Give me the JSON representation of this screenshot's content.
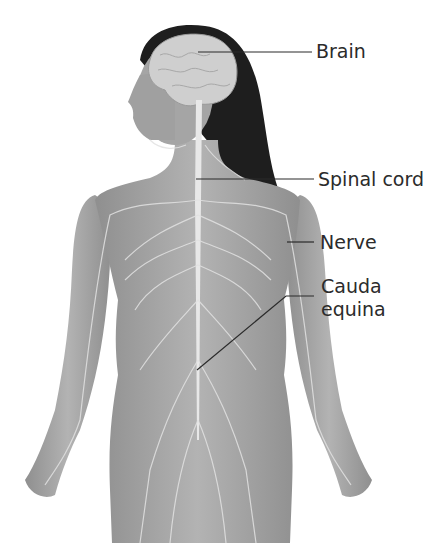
{
  "diagram": {
    "labels": [
      {
        "id": "brain",
        "text": "Brain",
        "x": 316,
        "y": 39
      },
      {
        "id": "spinal-cord",
        "text": "Spinal cord",
        "x": 318,
        "y": 167
      },
      {
        "id": "nerve",
        "text": "Nerve",
        "x": 320,
        "y": 231
      },
      {
        "id": "cauda-equina-1",
        "text": "Cauda",
        "x": 321,
        "y": 275
      },
      {
        "id": "cauda-equina-2",
        "text": "equina",
        "x": 321,
        "y": 298
      }
    ],
    "colors": {
      "skin": "#a9a9a9",
      "skin_dark": "#8c8c8c",
      "nerve": "#e6e6e6",
      "hair": "#1e1e1e",
      "brain": "#cfcfcf",
      "leader_line": "#2b2b2b",
      "label_text": "#2b2b2b"
    }
  }
}
